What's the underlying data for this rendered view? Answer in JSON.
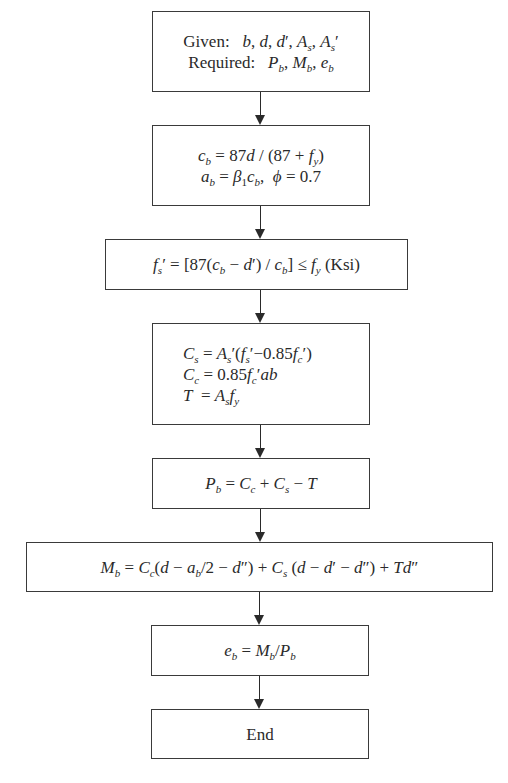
{
  "flowchart": {
    "nodes": [
      {
        "id": "given",
        "lines": [
          "Given:   b, d, d′, Aₛ, Aₛ′",
          "Required:   P_b, M_b, e_b"
        ]
      },
      {
        "id": "cb-ab",
        "lines": [
          "c_b = 87d / (87 + f_y)",
          "a_b = β₁c_b,  ϕ = 0.7"
        ]
      },
      {
        "id": "fs-prime",
        "lines": [
          "f_s′ = [87(c_b − d′) / c_b] ≤ f_y (Ksi)"
        ]
      },
      {
        "id": "forces",
        "lines": [
          "C_s = A_s′(f_s′−0.85f_c′)",
          "C_c = 0.85f_c′ab",
          "T  = A_s f_y"
        ]
      },
      {
        "id": "pb",
        "lines": [
          "P_b = C_c + C_s − T"
        ]
      },
      {
        "id": "mb",
        "lines": [
          "M_b = C_c(d − a_b/2 − d″) + C_s (d − d′ − d″) + Td″"
        ]
      },
      {
        "id": "eb",
        "lines": [
          "e_b = M_b/P_b"
        ]
      },
      {
        "id": "end",
        "lines": [
          "End"
        ]
      }
    ],
    "edges": [
      [
        "given",
        "cb-ab"
      ],
      [
        "cb-ab",
        "fs-prime"
      ],
      [
        "fs-prime",
        "forces"
      ],
      [
        "forces",
        "pb"
      ],
      [
        "pb",
        "mb"
      ],
      [
        "mb",
        "eb"
      ],
      [
        "eb",
        "end"
      ]
    ]
  },
  "labels": {
    "given": "Given:",
    "required": "Required:",
    "ksi": "(Ksi)",
    "end": "End"
  },
  "caption": "cropped caption text (illegible)"
}
